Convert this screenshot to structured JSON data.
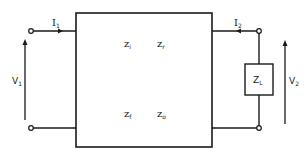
{
  "diagram": {
    "network_box": {
      "parameters": [
        {
          "name": "z_i",
          "base": "z",
          "sub": "i"
        },
        {
          "name": "z_r",
          "base": "z",
          "sub": "r"
        },
        {
          "name": "z_f",
          "base": "z",
          "sub": "f"
        },
        {
          "name": "z_o",
          "base": "z",
          "sub": "o"
        }
      ]
    },
    "port1": {
      "current": {
        "base": "I",
        "sub": "1"
      },
      "voltage": {
        "base": "V",
        "sub": "1"
      }
    },
    "port2": {
      "current": {
        "base": "I",
        "sub": "2"
      },
      "voltage": {
        "base": "V",
        "sub": "2"
      }
    },
    "load": {
      "base": "Z",
      "sub": "L"
    },
    "colors": {
      "stroke": "#1a1a1a",
      "background": "#ffffff"
    }
  }
}
